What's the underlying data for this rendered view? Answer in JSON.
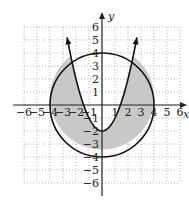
{
  "chart_data": {
    "type": "region",
    "title": "",
    "xlabel": "x",
    "ylabel": "y",
    "xlim": [
      -6,
      6
    ],
    "ylim": [
      -6,
      6
    ],
    "grid": true,
    "grid_style": "dotted",
    "x_ticks": [
      -6,
      -5,
      -4,
      -3,
      -2,
      -1,
      1,
      2,
      3,
      4,
      5,
      6
    ],
    "x_tick_labels": [
      "−6",
      "−5",
      "−4",
      "−3",
      "−2",
      "−1",
      "1",
      "2",
      "3",
      "4",
      "5",
      "6"
    ],
    "y_ticks": [
      6,
      5,
      4,
      3,
      2,
      1,
      -1,
      -2,
      -3,
      -4,
      -5,
      -6
    ],
    "y_tick_labels": [
      "6",
      "5",
      "4",
      "3",
      "2",
      "1",
      "−1",
      "−2",
      "−3",
      "−4",
      "−5",
      "−6"
    ],
    "curves": [
      {
        "name": "circle",
        "equation": "x^2 + y^2 = 16",
        "center": [
          0,
          0
        ],
        "radius": 4,
        "style": "solid"
      },
      {
        "name": "parabola",
        "equation": "y = x^2 - 2",
        "vertex": [
          0,
          -2
        ],
        "arrows": true,
        "style": "solid"
      }
    ],
    "shaded_region": {
      "description": "inside circle and below/outside parabola",
      "inequalities": [
        "x^2 + y^2 <= 16",
        "y <= x^2 - 2"
      ],
      "fill": "#c8c8c8"
    }
  },
  "colors": {
    "axis": "#222222",
    "curve": "#111111",
    "grid": "#9a9a9a",
    "shade": "#c8c8c8"
  }
}
